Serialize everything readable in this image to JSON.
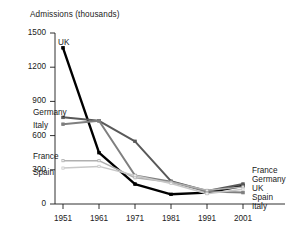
{
  "chart_data": {
    "type": "line",
    "title": "Admissions (thousands)",
    "xlabel": "",
    "ylabel": "Admissions (thousands)",
    "x": [
      1951,
      1961,
      1971,
      1981,
      1991,
      2001
    ],
    "xtick_labels": [
      "1951",
      "1961",
      "1971",
      "1981",
      "1991",
      "2001"
    ],
    "ytick_labels": [
      "0",
      "300",
      "600",
      "900",
      "1200",
      "1500"
    ],
    "yticks": [
      0,
      300,
      600,
      900,
      1200,
      1500
    ],
    "ylim": [
      0,
      1500
    ],
    "xlim": [
      1951,
      2001
    ],
    "grid": false,
    "legend": "inline-end-labels",
    "series": [
      {
        "name": "UK",
        "color": "#000000",
        "width": 2.4,
        "values": [
          1370,
          450,
          175,
          85,
          100,
          160
        ]
      },
      {
        "name": "Germany",
        "color": "#595959",
        "width": 2.0,
        "values": [
          760,
          730,
          550,
          200,
          115,
          175
        ]
      },
      {
        "name": "Italy",
        "color": "#7f7f7f",
        "width": 2.0,
        "values": [
          700,
          730,
          250,
          195,
          110,
          100
        ]
      },
      {
        "name": "France",
        "color": "#b0b0b0",
        "width": 1.5,
        "values": [
          380,
          380,
          230,
          190,
          120,
          150
        ]
      },
      {
        "name": "Spain",
        "color": "#c8c8c8",
        "width": 1.5,
        "values": [
          315,
          330,
          250,
          180,
          90,
          130
        ]
      }
    ],
    "left_labels": [
      "Germany",
      "Italy",
      "France",
      "Spain",
      "UK"
    ],
    "right_labels": [
      "France",
      "Germany",
      "UK",
      "Spain",
      "Italy"
    ]
  },
  "labels": {
    "title": "Admissions (thousands)",
    "uk": "UK",
    "germany": "Germany",
    "italy": "Italy",
    "france": "France",
    "spain": "Spain",
    "y0": "0",
    "y300": "300",
    "y600": "600",
    "y900": "900",
    "y1200": "1200",
    "y1500": "1500",
    "x1951": "1951",
    "x1961": "1961",
    "x1971": "1971",
    "x1981": "1981",
    "x1991": "1991",
    "x2001": "2001",
    "right_france": "France",
    "right_germany": "Germany",
    "right_uk": "UK",
    "right_spain": "Spain",
    "right_italy": "Italy"
  }
}
